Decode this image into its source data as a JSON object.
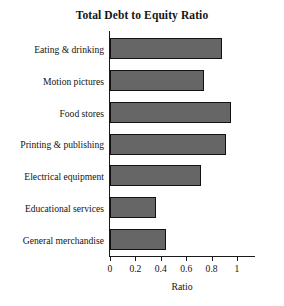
{
  "chart_data": {
    "type": "bar",
    "orientation": "horizontal",
    "title": "Total Debt to Equity Ratio",
    "xlabel": "Ratio",
    "ylabel": "",
    "categories": [
      "Eating & drinking",
      "Motion pictures",
      "Food stores",
      "Printing & publishing",
      "Electrical equipment",
      "Educational services",
      "General merchandise"
    ],
    "values": [
      0.88,
      0.74,
      0.95,
      0.91,
      0.72,
      0.36,
      0.44
    ],
    "xlim": [
      0,
      1
    ],
    "xticks": [
      0,
      0.2,
      0.4,
      0.6,
      0.8,
      1
    ],
    "xtick_labels": [
      "0",
      "0.2",
      "0.4",
      "0.6",
      "0.8",
      "1"
    ],
    "grid": false,
    "legend": false,
    "bar_color": "#666666",
    "bar_edge_color": "#111111",
    "axis_color": "#1a1a1a",
    "background": "#ffffff",
    "text_color": "#141414"
  }
}
